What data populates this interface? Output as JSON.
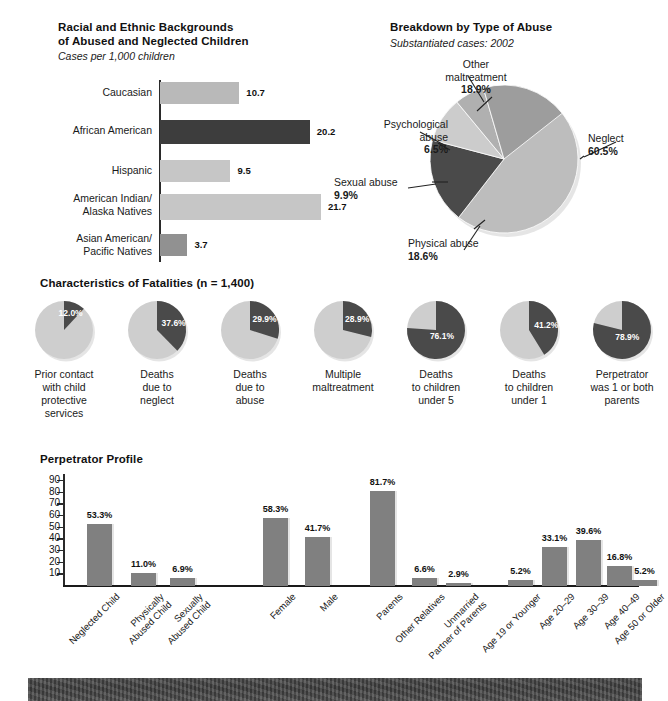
{
  "colors": {
    "dark": "#3d3d3d",
    "mid": "#8f8f8f",
    "light": "#c3c3c3",
    "lighter": "#cfcfcf",
    "text": "#1a1a1a",
    "axis": "#2a2a2a"
  },
  "race_panel": {
    "title_line1": "Racial and Ethnic Backgrounds",
    "title_line2": "of Abused and Neglected Children",
    "subtitle": "Cases per 1,000 children"
  },
  "abuse_panel": {
    "title": "Breakdown by Type of Abuse",
    "subtitle": "Substantiated cases: 2002"
  },
  "fatalities_panel": {
    "title": "Characteristics of Fatalities (n = 1,400)"
  },
  "perpetrator_panel": {
    "title": "Perpetrator Profile"
  },
  "chart_data": [
    {
      "id": "race-bars",
      "type": "bar",
      "orientation": "horizontal",
      "title": "Racial and Ethnic Backgrounds of Abused and Neglected Children",
      "subtitle": "Cases per 1,000 children",
      "xlabel": "",
      "ylabel": "",
      "xlim": [
        0,
        24
      ],
      "grid": false,
      "legend": "none",
      "categories": [
        "Caucasian",
        "African American",
        "Hispanic",
        "American Indian/\nAlaska Natives",
        "Asian American/\nPacific Natives"
      ],
      "category_lines": [
        [
          "Caucasian"
        ],
        [
          "African American"
        ],
        [
          "Hispanic"
        ],
        [
          "American Indian/",
          "Alaska Natives"
        ],
        [
          "Asian American/",
          "Pacific Natives"
        ]
      ],
      "values": [
        10.7,
        20.2,
        9.5,
        21.7,
        3.7
      ],
      "value_labels": [
        "10.7",
        "20.2",
        "9.5",
        "21.7",
        "3.7"
      ],
      "bar_colors": [
        "#b9b9b9",
        "#3d3d3d",
        "#c6c6c6",
        "#c6c6c6",
        "#919191"
      ]
    },
    {
      "id": "abuse-pie",
      "type": "pie",
      "title": "Breakdown by Type of Abuse",
      "subtitle": "Substantiated cases: 2002",
      "legend": "callouts",
      "labels": [
        "Neglect",
        "Physical abuse",
        "Sexual abuse",
        "Psychological abuse",
        "Other maltreatment"
      ],
      "values": [
        60.5,
        18.6,
        9.9,
        6.5,
        18.9
      ],
      "value_labels": [
        "60.5%",
        "18.6%",
        "9.9%",
        "6.5%",
        "18.9%"
      ],
      "slice_colors": [
        "#bdbdbd",
        "#4a4a4a",
        "#cccccc",
        "#b0b0b0",
        "#9d9d9d"
      ]
    },
    {
      "id": "fatalities-pies",
      "type": "pie",
      "title": "Characteristics of Fatalities (n = 1,400)",
      "legend": "none",
      "series": [
        {
          "name": "Prior contact with child protective services",
          "lines": [
            "Prior contact",
            "with child",
            "protective",
            "services"
          ],
          "value": 12.0,
          "value_label": "12.0%"
        },
        {
          "name": "Deaths due to neglect",
          "lines": [
            "Deaths",
            "due to",
            "neglect"
          ],
          "value": 37.6,
          "value_label": "37.6%"
        },
        {
          "name": "Deaths due to abuse",
          "lines": [
            "Deaths",
            "due to",
            "abuse"
          ],
          "value": 29.9,
          "value_label": "29.9%"
        },
        {
          "name": "Multiple maltreatment",
          "lines": [
            "Multiple",
            "maltreatment"
          ],
          "value": 28.9,
          "value_label": "28.9%"
        },
        {
          "name": "Deaths to children under 5",
          "lines": [
            "Deaths",
            "to children",
            "under 5"
          ],
          "value": 76.1,
          "value_label": "76.1%"
        },
        {
          "name": "Deaths to children under 1",
          "lines": [
            "Deaths",
            "to children",
            "under 1"
          ],
          "value": 41.2,
          "value_label": "41.2%"
        },
        {
          "name": "Perpetrator was 1 or both parents",
          "lines": [
            "Perpetrator",
            "was 1 or both",
            "parents"
          ],
          "value": 78.9,
          "value_label": "78.9%"
        }
      ],
      "slice_color_filled": "#4a4a4a",
      "slice_color_rest": "#cecece"
    },
    {
      "id": "perpetrator-bars",
      "type": "bar",
      "orientation": "vertical",
      "title": "Perpetrator Profile",
      "xlabel": "",
      "ylabel": "",
      "ylim": [
        0,
        95
      ],
      "yticks": [
        10,
        20,
        30,
        40,
        50,
        60,
        70,
        80,
        90
      ],
      "ytick_labels": [
        "10",
        "20",
        "30",
        "40",
        "50",
        "60",
        "70",
        "80",
        "90"
      ],
      "grid": false,
      "legend": "none",
      "bar_color": "#808080",
      "groups": [
        {
          "name": "victim-type",
          "categories": [
            "Neglected Child",
            "Physically Abused Child",
            "Sexually Abused Child"
          ],
          "category_lines": [
            [
              "Neglected Child"
            ],
            [
              "Physically",
              "Abused Child"
            ],
            [
              "Sexually",
              "Abused Child"
            ]
          ],
          "values": [
            53.3,
            11.0,
            6.9
          ],
          "value_labels": [
            "53.3%",
            "11.0%",
            "6.9%"
          ]
        },
        {
          "name": "gender",
          "categories": [
            "Female",
            "Male"
          ],
          "category_lines": [
            [
              "Female"
            ],
            [
              "Male"
            ]
          ],
          "values": [
            58.3,
            41.7
          ],
          "value_labels": [
            "58.3%",
            "41.7%"
          ]
        },
        {
          "name": "relationship",
          "categories": [
            "Parents",
            "Other Relatives",
            "Unmarried Partner of Parents"
          ],
          "category_lines": [
            [
              "Parents"
            ],
            [
              "Other Relatives"
            ],
            [
              "Unmarried",
              "Partner of Parents"
            ]
          ],
          "values": [
            81.7,
            6.6,
            2.9
          ],
          "value_labels": [
            "81.7%",
            "6.6%",
            "2.9%"
          ]
        },
        {
          "name": "age",
          "categories": [
            "Age 19 or Younger",
            "Age 20-29",
            "Age 30-39",
            "Age 40-49",
            "Age 50 or Older"
          ],
          "category_lines": [
            [
              "Age 19 or Younger"
            ],
            [
              "Age 20–29"
            ],
            [
              "Age 30–39"
            ],
            [
              "Age 40–49"
            ],
            [
              "Age 50 or Older"
            ]
          ],
          "values": [
            5.2,
            33.1,
            39.6,
            16.8,
            5.2
          ],
          "value_labels": [
            "5.2%",
            "33.1%",
            "39.6%",
            "16.8%",
            "5.2%"
          ]
        }
      ]
    }
  ]
}
